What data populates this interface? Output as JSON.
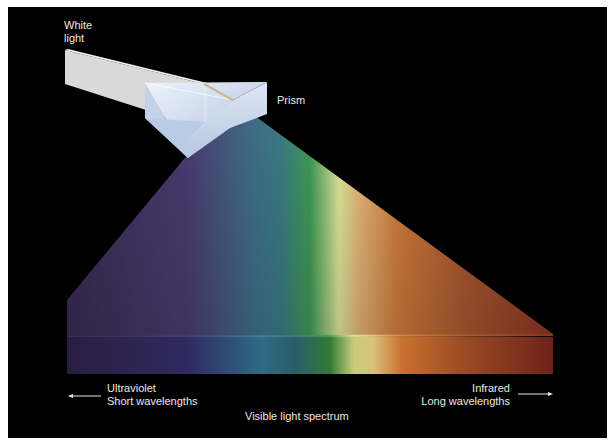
{
  "diagram": {
    "labels": {
      "white_light_line1": "White",
      "white_light_line2": "light",
      "prism": "Prism",
      "ultraviolet": "Ultraviolet",
      "short_wavelengths": "Short wavelengths",
      "visible_spectrum": "Visible light spectrum",
      "infrared": "Infrared",
      "long_wavelengths": "Long wavelengths"
    },
    "arrows": [
      {
        "name": "short-wavelength-arrow",
        "direction": "left"
      },
      {
        "name": "long-wavelength-arrow",
        "direction": "right"
      }
    ],
    "colors": {
      "background": "#000000",
      "border": "#ffffff",
      "text": "#e8e8e8",
      "white_beam": "#dcdcdc",
      "prism_glass": "#c9d6ea"
    },
    "spectrum_stops": [
      {
        "offset": "0%",
        "color": "#2a1d40"
      },
      {
        "offset": "25%",
        "color": "#2f2a60"
      },
      {
        "offset": "40%",
        "color": "#2f6a85"
      },
      {
        "offset": "47%",
        "color": "#2a5d6b"
      },
      {
        "offset": "54%",
        "color": "#2f7a35"
      },
      {
        "offset": "59%",
        "color": "#c8cc7a"
      },
      {
        "offset": "63%",
        "color": "#d8c27a"
      },
      {
        "offset": "69%",
        "color": "#c8702d"
      },
      {
        "offset": "82%",
        "color": "#9a4a25"
      },
      {
        "offset": "100%",
        "color": "#6e2218"
      }
    ]
  }
}
